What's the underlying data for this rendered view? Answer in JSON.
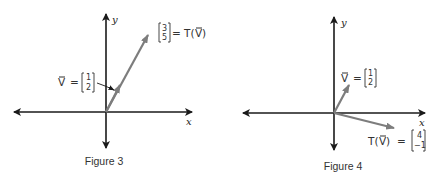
{
  "figures": [
    {
      "id": "figure-3",
      "caption": "Figure 3",
      "axes": {
        "x_label": "x",
        "y_label": "y"
      },
      "vector_v": {
        "label": "V",
        "prefix": "",
        "equals": "=",
        "components": [
          "1",
          "2"
        ]
      },
      "vector_tv": {
        "label": "T(V)",
        "lhs_prefix": "T(",
        "lhs_var": "V",
        "lhs_suffix": ")",
        "equals": "=",
        "components": [
          "3",
          "5"
        ]
      }
    },
    {
      "id": "figure-4",
      "caption": "Figure 4",
      "axes": {
        "x_label": "x",
        "y_label": "y"
      },
      "vector_v": {
        "label": "V",
        "equals": "=",
        "components": [
          "1",
          "2"
        ]
      },
      "vector_tv": {
        "label": "T(V)",
        "lhs_prefix": "T(",
        "lhs_var": "V",
        "lhs_suffix": ")",
        "equals": "=",
        "components": [
          "4",
          "-1"
        ]
      }
    }
  ],
  "colors": {
    "axis": "#1a1a1a",
    "vector": "#7d7d7d",
    "text": "#333333",
    "background": "#ffffff"
  }
}
